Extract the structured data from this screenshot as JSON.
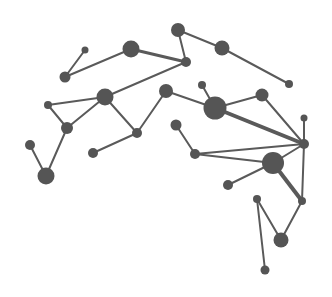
{
  "diagram": {
    "type": "network-graph",
    "width": 332,
    "height": 297,
    "colors": {
      "background": "#ffffff",
      "node": "#555555",
      "edge": "#5a5a5a"
    },
    "nodes": [
      {
        "id": "A",
        "x": 178,
        "y": 30,
        "r": 7
      },
      {
        "id": "B",
        "x": 222,
        "y": 48,
        "r": 7.5
      },
      {
        "id": "C",
        "x": 289,
        "y": 84,
        "r": 4
      },
      {
        "id": "D",
        "x": 186,
        "y": 62,
        "r": 5
      },
      {
        "id": "E",
        "x": 131,
        "y": 49,
        "r": 8.5
      },
      {
        "id": "F",
        "x": 85,
        "y": 50,
        "r": 3.5
      },
      {
        "id": "G",
        "x": 65,
        "y": 77,
        "r": 5.5
      },
      {
        "id": "H",
        "x": 105,
        "y": 97,
        "r": 8.5
      },
      {
        "id": "I",
        "x": 48,
        "y": 105,
        "r": 4
      },
      {
        "id": "J",
        "x": 67,
        "y": 128,
        "r": 6
      },
      {
        "id": "K",
        "x": 30,
        "y": 145,
        "r": 5
      },
      {
        "id": "L",
        "x": 46,
        "y": 176,
        "r": 8.5
      },
      {
        "id": "M",
        "x": 137,
        "y": 133,
        "r": 5
      },
      {
        "id": "N",
        "x": 93,
        "y": 153,
        "r": 5
      },
      {
        "id": "O",
        "x": 166,
        "y": 91,
        "r": 7
      },
      {
        "id": "P",
        "x": 202,
        "y": 85,
        "r": 4
      },
      {
        "id": "Q",
        "x": 215,
        "y": 108,
        "r": 11.5
      },
      {
        "id": "R",
        "x": 262,
        "y": 95,
        "r": 6.5
      },
      {
        "id": "S",
        "x": 304,
        "y": 118,
        "r": 3.5
      },
      {
        "id": "T",
        "x": 304,
        "y": 144,
        "r": 5
      },
      {
        "id": "U",
        "x": 176,
        "y": 125,
        "r": 5.5
      },
      {
        "id": "V",
        "x": 195,
        "y": 154,
        "r": 5
      },
      {
        "id": "W",
        "x": 273,
        "y": 163,
        "r": 11
      },
      {
        "id": "X",
        "x": 228,
        "y": 185,
        "r": 5
      },
      {
        "id": "Y",
        "x": 257,
        "y": 199,
        "r": 4
      },
      {
        "id": "Z",
        "x": 302,
        "y": 201,
        "r": 4
      },
      {
        "id": "AA",
        "x": 281,
        "y": 240,
        "r": 7.5
      },
      {
        "id": "AB",
        "x": 265,
        "y": 270,
        "r": 4.5
      }
    ],
    "edges": [
      {
        "from": "A",
        "to": "B",
        "w": 2
      },
      {
        "from": "B",
        "to": "C",
        "w": 2
      },
      {
        "from": "A",
        "to": "D",
        "w": 2
      },
      {
        "from": "E",
        "to": "D",
        "w": 3
      },
      {
        "from": "G",
        "to": "E",
        "w": 2
      },
      {
        "from": "G",
        "to": "F",
        "w": 2
      },
      {
        "from": "H",
        "to": "D",
        "w": 2
      },
      {
        "from": "I",
        "to": "H",
        "w": 2
      },
      {
        "from": "I",
        "to": "J",
        "w": 2
      },
      {
        "from": "J",
        "to": "H",
        "w": 2
      },
      {
        "from": "J",
        "to": "L",
        "w": 2
      },
      {
        "from": "K",
        "to": "L",
        "w": 2
      },
      {
        "from": "H",
        "to": "M",
        "w": 2
      },
      {
        "from": "M",
        "to": "O",
        "w": 2
      },
      {
        "from": "N",
        "to": "M",
        "w": 2
      },
      {
        "from": "O",
        "to": "Q",
        "w": 2
      },
      {
        "from": "P",
        "to": "Q",
        "w": 2
      },
      {
        "from": "Q",
        "to": "R",
        "w": 2
      },
      {
        "from": "Q",
        "to": "T",
        "w": 4
      },
      {
        "from": "R",
        "to": "T",
        "w": 2
      },
      {
        "from": "S",
        "to": "T",
        "w": 2
      },
      {
        "from": "U",
        "to": "V",
        "w": 2
      },
      {
        "from": "V",
        "to": "T",
        "w": 2
      },
      {
        "from": "V",
        "to": "W",
        "w": 2
      },
      {
        "from": "W",
        "to": "T",
        "w": 2
      },
      {
        "from": "X",
        "to": "W",
        "w": 2
      },
      {
        "from": "W",
        "to": "Z",
        "w": 4
      },
      {
        "from": "T",
        "to": "Z",
        "w": 2
      },
      {
        "from": "Z",
        "to": "AA",
        "w": 2
      },
      {
        "from": "Y",
        "to": "AA",
        "w": 2
      },
      {
        "from": "Y",
        "to": "AB",
        "w": 2
      }
    ]
  }
}
